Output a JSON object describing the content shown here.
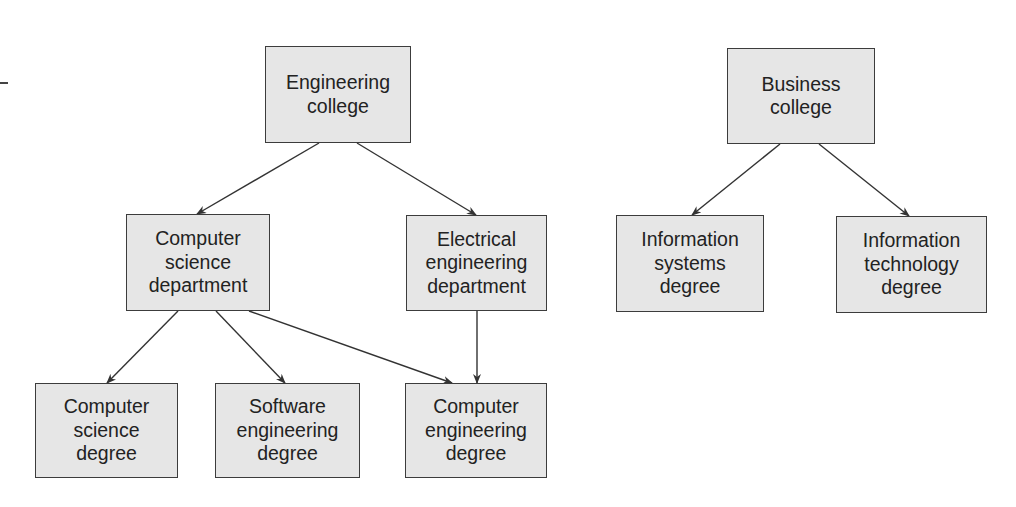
{
  "diagram": {
    "type": "hierarchy",
    "nodes": [
      {
        "id": "engineering_college",
        "label": "Engineering\ncollege",
        "x": 265,
        "y": 46,
        "w": 146,
        "h": 97
      },
      {
        "id": "business_college",
        "label": "Business\ncollege",
        "x": 727,
        "y": 48,
        "w": 148,
        "h": 96
      },
      {
        "id": "cs_department",
        "label": "Computer\nscience\ndepartment",
        "x": 126,
        "y": 214,
        "w": 144,
        "h": 97
      },
      {
        "id": "ee_department",
        "label": "Electrical\nengineering\ndepartment",
        "x": 406,
        "y": 215,
        "w": 141,
        "h": 96
      },
      {
        "id": "is_degree",
        "label": "Information\nsystems\ndegree",
        "x": 616,
        "y": 215,
        "w": 148,
        "h": 97
      },
      {
        "id": "it_degree",
        "label": "Information\ntechnology\ndegree",
        "x": 836,
        "y": 216,
        "w": 151,
        "h": 97
      },
      {
        "id": "cs_degree",
        "label": "Computer\nscience\ndegree",
        "x": 35,
        "y": 383,
        "w": 143,
        "h": 95
      },
      {
        "id": "se_degree",
        "label": "Software\nengineering\ndegree",
        "x": 215,
        "y": 383,
        "w": 145,
        "h": 95
      },
      {
        "id": "ce_degree",
        "label": "Computer\nengineering\ndegree",
        "x": 405,
        "y": 383,
        "w": 142,
        "h": 95
      }
    ],
    "edges": [
      {
        "from": "engineering_college",
        "to": "cs_department",
        "x1": 319,
        "y1": 143,
        "x2": 197,
        "y2": 214
      },
      {
        "from": "engineering_college",
        "to": "ee_department",
        "x1": 357,
        "y1": 143,
        "x2": 476,
        "y2": 215
      },
      {
        "from": "business_college",
        "to": "is_degree",
        "x1": 780,
        "y1": 144,
        "x2": 692,
        "y2": 215
      },
      {
        "from": "business_college",
        "to": "it_degree",
        "x1": 819,
        "y1": 144,
        "x2": 909,
        "y2": 216
      },
      {
        "from": "cs_department",
        "to": "cs_degree",
        "x1": 178,
        "y1": 311,
        "x2": 107,
        "y2": 383
      },
      {
        "from": "cs_department",
        "to": "se_degree",
        "x1": 216,
        "y1": 311,
        "x2": 285,
        "y2": 383
      },
      {
        "from": "cs_department",
        "to": "ce_degree",
        "x1": 249,
        "y1": 311,
        "x2": 452,
        "y2": 383
      },
      {
        "from": "ee_department",
        "to": "ce_degree",
        "x1": 477,
        "y1": 311,
        "x2": 477,
        "y2": 383
      }
    ],
    "colors": {
      "box_fill": "#e6e6e6",
      "box_border": "#3c3c3c",
      "text": "#222222",
      "edge": "#333333"
    }
  }
}
